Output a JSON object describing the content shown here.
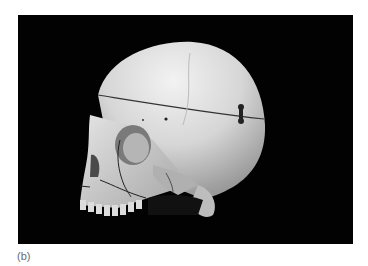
{
  "figure": {
    "caption": "(b)",
    "background_color": "#020202",
    "bone_color": "#d9d9d9"
  }
}
